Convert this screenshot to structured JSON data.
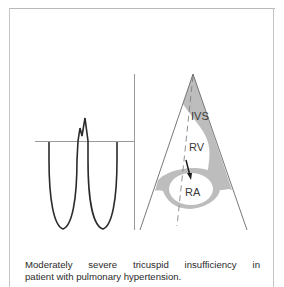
{
  "figure": {
    "labels": {
      "ivs": "IVS",
      "rv": "RV",
      "ra": "RA"
    },
    "colors": {
      "frame": "#c4c4c4",
      "waveform": "#2b2b2b",
      "baseline": "#9a9a9a",
      "tissue_fill": "#bdbdbd",
      "sector_edge": "#555555",
      "text": "#2a2a2a"
    }
  },
  "caption": {
    "line1": "Moderately severe tricuspid insufficiency in",
    "line2": "patient with pulmonary hypertension."
  }
}
